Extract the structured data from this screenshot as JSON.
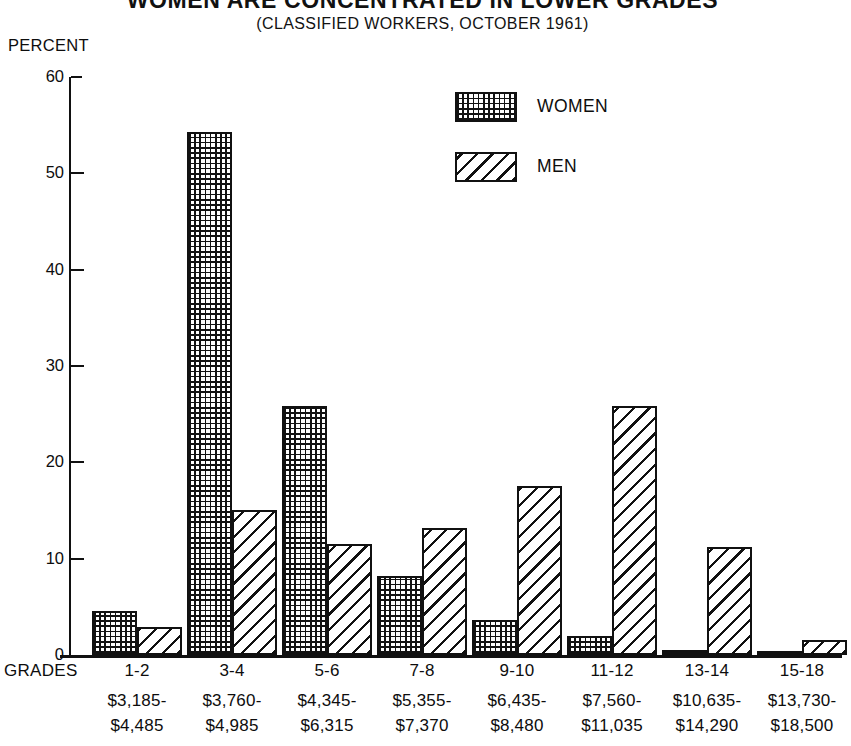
{
  "chart_data": {
    "type": "bar",
    "title": "WOMEN ARE CONCENTRATED IN LOWER GRADES",
    "subtitle": "(CLASSIFIED WORKERS, OCTOBER 1961)",
    "xlabel": "GRADES",
    "ylabel": "PERCENT",
    "ylim": [
      0,
      60
    ],
    "yticks": [
      0,
      10,
      20,
      30,
      40,
      50,
      60
    ],
    "grid": false,
    "legend_position": "top-center-right",
    "categories": [
      "1-2",
      "3-4",
      "5-6",
      "7-8",
      "9-10",
      "11-12",
      "13-14",
      "15-18"
    ],
    "category_salary_ranges": [
      {
        "from": "$3,185-",
        "to": "$4,485"
      },
      {
        "from": "$3,760-",
        "to": "$4,985"
      },
      {
        "from": "$4,345-",
        "to": "$6,315"
      },
      {
        "from": "$5,355-",
        "to": "$7,370"
      },
      {
        "from": "$6,435-",
        "to": "$8,480"
      },
      {
        "from": "$7,560-",
        "to": "$11,035"
      },
      {
        "from": "$10,635-",
        "to": "$14,290"
      },
      {
        "from": "$13,730-",
        "to": "$18,500"
      }
    ],
    "series": [
      {
        "name": "WOMEN",
        "pattern": "dotted-grid",
        "values": [
          4.6,
          54.3,
          25.9,
          8.2,
          3.6,
          2.0,
          0.5,
          0.3
        ]
      },
      {
        "name": "MEN",
        "pattern": "diagonal-hatch",
        "values": [
          2.9,
          15.1,
          11.5,
          13.2,
          17.5,
          25.8,
          11.2,
          1.6
        ]
      }
    ]
  },
  "legend": {
    "items": [
      {
        "label": "WOMEN"
      },
      {
        "label": "MEN"
      }
    ]
  },
  "colors": {
    "ink": "#111111",
    "background": "#ffffff"
  }
}
